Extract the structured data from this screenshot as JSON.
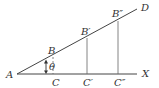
{
  "diagram": {
    "title": "",
    "points": {
      "A": "A",
      "B": "B",
      "B1": "B′",
      "B2": "B″",
      "C": "C",
      "C1": "C′",
      "C2": "C″",
      "D": "D",
      "X": "X"
    },
    "angle_label": "θ"
  }
}
